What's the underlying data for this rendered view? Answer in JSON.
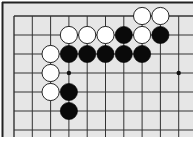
{
  "board": {
    "background": "#e6e6e6",
    "line_color": "#333333",
    "border_color": "#222222",
    "origin_x": 14,
    "origin_y": 16,
    "spacing_x": 18.3,
    "spacing_y": 19,
    "cols": 10,
    "rows": 7,
    "stone_radius": 8.6,
    "star_points": [
      [
        3,
        3
      ],
      [
        9,
        3
      ]
    ],
    "stones": [
      {
        "color": "white",
        "col": 7,
        "row": 0
      },
      {
        "color": "white",
        "col": 8,
        "row": 0
      },
      {
        "color": "white",
        "col": 3,
        "row": 1
      },
      {
        "color": "white",
        "col": 4,
        "row": 1
      },
      {
        "color": "white",
        "col": 5,
        "row": 1
      },
      {
        "color": "black",
        "col": 6,
        "row": 1
      },
      {
        "color": "white",
        "col": 7,
        "row": 1
      },
      {
        "color": "black",
        "col": 8,
        "row": 1
      },
      {
        "color": "white",
        "col": 2,
        "row": 2
      },
      {
        "color": "black",
        "col": 3,
        "row": 2
      },
      {
        "color": "black",
        "col": 4,
        "row": 2
      },
      {
        "color": "black",
        "col": 5,
        "row": 2
      },
      {
        "color": "black",
        "col": 6,
        "row": 2
      },
      {
        "color": "black",
        "col": 7,
        "row": 2
      },
      {
        "color": "white",
        "col": 2,
        "row": 3
      },
      {
        "color": "white",
        "col": 2,
        "row": 4
      },
      {
        "color": "black",
        "col": 3,
        "row": 4
      },
      {
        "color": "black",
        "col": 3,
        "row": 5
      }
    ]
  }
}
